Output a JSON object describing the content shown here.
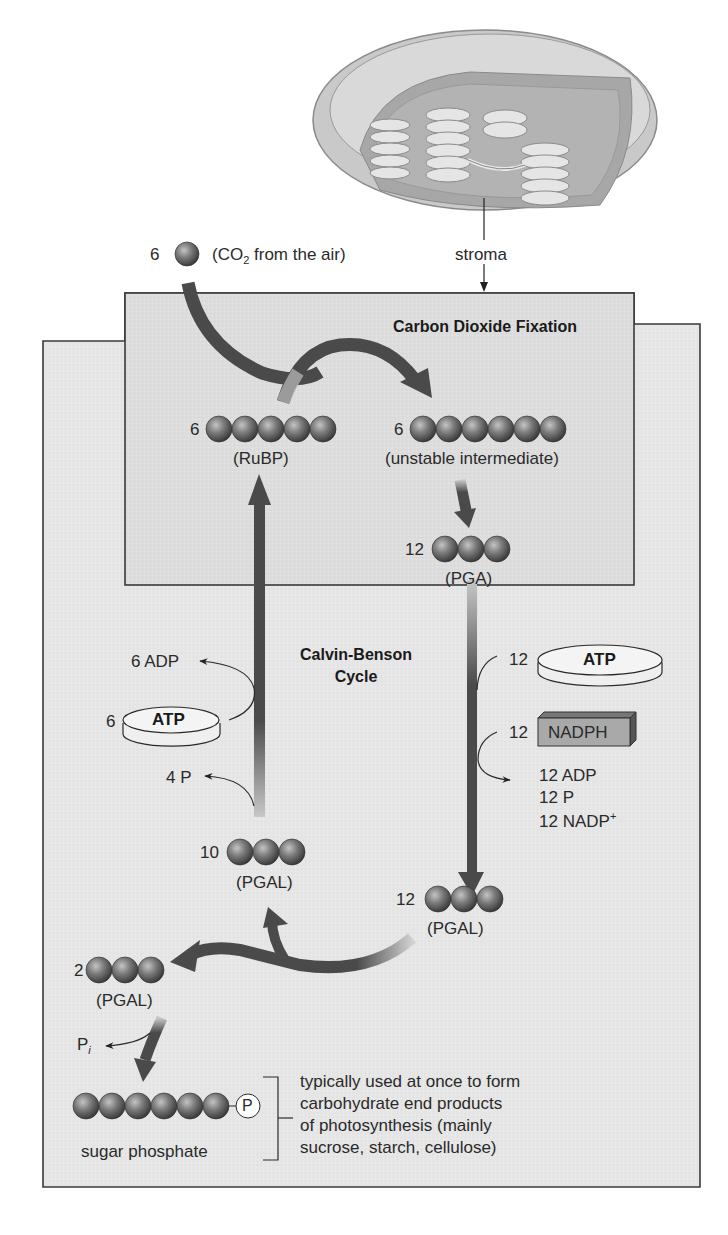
{
  "diagram": {
    "title_region": "Carbon Dioxide Fixation",
    "cycle_label_line1": "Calvin-Benson",
    "cycle_label_line2": "Cycle",
    "chloroplast": {
      "label": "stroma",
      "icon": "chloroplast-illustration"
    },
    "co2_input": {
      "count": "6",
      "label_prefix": "(CO",
      "label_sub": "2",
      "label_suffix": " from the air)"
    },
    "molecules": {
      "rubp": {
        "count": "6",
        "carbons": 5,
        "label": "(RuBP)"
      },
      "unstable": {
        "count": "6",
        "carbons": 6,
        "label": "(unstable intermediate)"
      },
      "pga": {
        "count": "12",
        "carbons": 3,
        "label": "(PGA)"
      },
      "pgal_12": {
        "count": "12",
        "carbons": 3,
        "label": "(PGAL)"
      },
      "pgal_10": {
        "count": "10",
        "carbons": 3,
        "label": "(PGAL)"
      },
      "pgal_2": {
        "count": "2",
        "carbons": 3,
        "label": "(PGAL)"
      },
      "sugar_phosphate": {
        "carbons": 6,
        "phosphate": "P",
        "label": "sugar phosphate"
      }
    },
    "energy_right": {
      "atp_count": "12",
      "atp_label": "ATP",
      "nadph_count": "12",
      "nadph_label": "NADPH",
      "outputs": [
        "12 ADP",
        "12 P",
        "12 NADP"
      ],
      "nadp_sup": "+"
    },
    "energy_left": {
      "adp_out": "6 ADP",
      "atp_count": "6",
      "atp_label": "ATP",
      "p_out": "4 P"
    },
    "pi_label": "P",
    "pi_sub": "i",
    "end_products_note": [
      "typically used at once to form",
      "carbohydrate end products",
      "of photosynthesis (mainly",
      "sucrose, starch, cellulose)"
    ],
    "colors": {
      "panel_fill": "#e9e9e9",
      "inner_fill": "#dedede",
      "border": "#3a3a3a",
      "arrow": "#4a4a4a",
      "sphere_dark": "#3e3e3e",
      "sphere_light": "#b8b8b8",
      "nadph_fill": "#a9a9a9"
    }
  }
}
